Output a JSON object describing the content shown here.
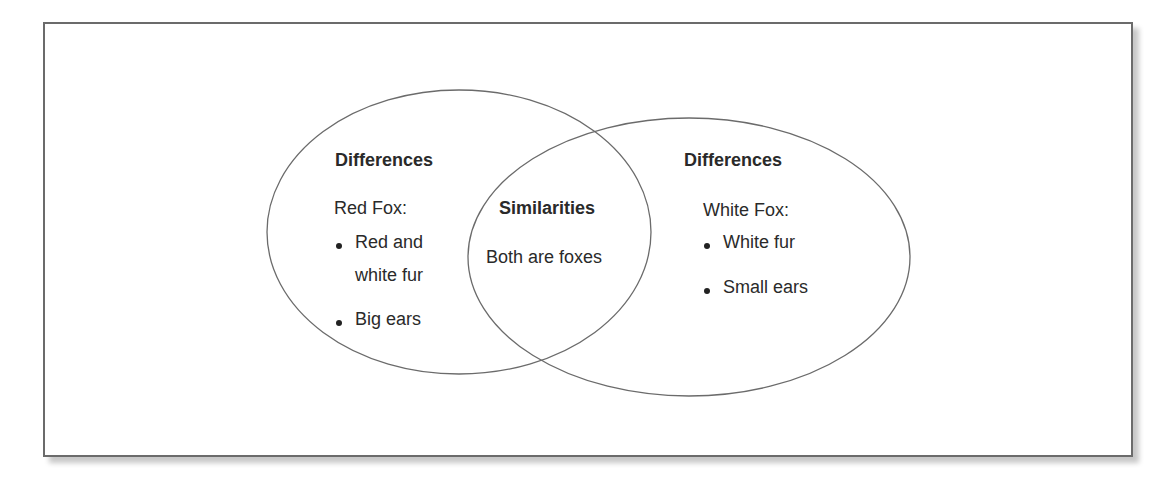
{
  "left_circle": {
    "heading": "Differences",
    "subject": "Red Fox:",
    "items": [
      "Red and",
      "white fur",
      "Big ears"
    ]
  },
  "overlap": {
    "heading": "Similarities",
    "text": "Both are foxes"
  },
  "right_circle": {
    "heading": "Differences",
    "subject": "White Fox:",
    "items": [
      "White fur",
      "Small ears"
    ]
  },
  "colors": {
    "stroke": "#6b6b6b",
    "text": "#2a2a2a"
  }
}
